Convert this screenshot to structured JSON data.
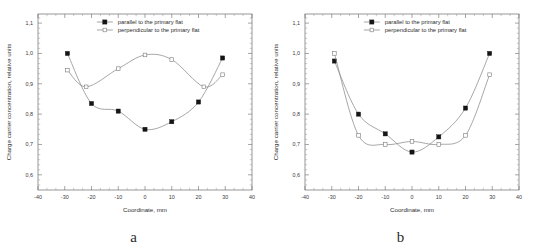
{
  "figure": {
    "panels": [
      {
        "label": "a",
        "label_name": "panel-label-a"
      },
      {
        "label": "b",
        "label_name": "panel-label-b"
      }
    ]
  },
  "legend": {
    "series_parallel_label": "parallel to the primary flat",
    "series_perpendicular_label": "perpendicular to the primary flat",
    "marker_parallel": "filled-square",
    "marker_perpendicular": "open-square"
  },
  "axes": {
    "xlabel": "Coordinate, mm",
    "ylabel": "Charge carrier concentration, relative units",
    "xticks": [
      "-40",
      "-30",
      "-20",
      "-10",
      "0",
      "10",
      "20",
      "30",
      "40"
    ],
    "yticks": [
      "0,6",
      "0,7",
      "0,8",
      "0,9",
      "1,0",
      "1,1"
    ],
    "xlim": [
      -40,
      40
    ],
    "ylim": [
      0.55,
      1.13
    ],
    "x_minor_per_major": 2,
    "y_minor_per_major": 5
  },
  "colors": {
    "axis": "#6b6b6b",
    "curve": "#8a8a8a",
    "marker_fill": "#151515",
    "marker_open_stroke": "#7b7b7b",
    "text": "#2b2b2b",
    "background": "#ffffff"
  },
  "chart_data": [
    {
      "type": "scatter",
      "panel": "a",
      "title": "",
      "xlabel": "Coordinate, mm",
      "ylabel": "Charge carrier concentration, relative units",
      "xlim": [
        -40,
        40
      ],
      "ylim": [
        0.55,
        1.13
      ],
      "xticks": [
        -40,
        -30,
        -20,
        -10,
        0,
        10,
        20,
        30,
        40
      ],
      "yticks": [
        0.6,
        0.7,
        0.8,
        0.9,
        1.0,
        1.1
      ],
      "grid": false,
      "legend_position": "top-center",
      "series": [
        {
          "name": "parallel to the primary flat",
          "marker": "filled-square",
          "x": [
            -29,
            -20,
            -10,
            0,
            10,
            20,
            29
          ],
          "values": [
            1.0,
            0.835,
            0.81,
            0.75,
            0.775,
            0.84,
            0.985
          ]
        },
        {
          "name": "perpendicular to the primary flat",
          "marker": "open-square",
          "x": [
            -29,
            -22,
            -10,
            0,
            10,
            22,
            29
          ],
          "values": [
            0.945,
            0.89,
            0.95,
            0.995,
            0.98,
            0.89,
            0.93
          ]
        }
      ]
    },
    {
      "type": "scatter",
      "panel": "b",
      "title": "",
      "xlabel": "Coordinate, mm",
      "ylabel": "Charge carrier concentration, relative units",
      "xlim": [
        -40,
        40
      ],
      "ylim": [
        0.55,
        1.13
      ],
      "xticks": [
        -40,
        -30,
        -20,
        -10,
        0,
        10,
        20,
        30,
        40
      ],
      "yticks": [
        0.6,
        0.7,
        0.8,
        0.9,
        1.0,
        1.1
      ],
      "grid": false,
      "legend_position": "top-center",
      "series": [
        {
          "name": "parallel to the primary flat",
          "marker": "filled-square",
          "x": [
            -29,
            -20,
            -10,
            0,
            10,
            20,
            29
          ],
          "values": [
            0.975,
            0.8,
            0.735,
            0.675,
            0.725,
            0.82,
            1.0
          ]
        },
        {
          "name": "perpendicular to the primary flat",
          "marker": "open-square",
          "x": [
            -29,
            -20,
            -10,
            0,
            10,
            20,
            29
          ],
          "values": [
            1.0,
            0.73,
            0.7,
            0.71,
            0.7,
            0.73,
            0.93
          ]
        }
      ]
    }
  ]
}
